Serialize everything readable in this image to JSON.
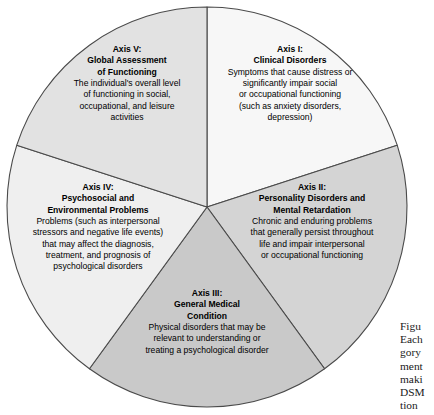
{
  "figure": {
    "type": "pie-segment-diagram",
    "title_visible": false,
    "center": {
      "x": 207,
      "y": 207
    },
    "radius": 200,
    "outline_color": "#4a4a4a",
    "segments": [
      {
        "id": "axis-1",
        "label": "Axis I",
        "title_lines": [
          "Axis I:",
          "Clinical Disorders"
        ],
        "body_lines": [
          "Symptoms that cause distress or",
          "significantly impair social",
          "or occupational functioning",
          "(such as anxiety disorders,",
          "depression)"
        ],
        "fill": "#f7f7f7",
        "start_angle_deg": 0,
        "end_angle_deg": 72,
        "text_anchor": {
          "x": 290,
          "y": 52
        }
      },
      {
        "id": "axis-2",
        "label": "Axis II",
        "title_lines": [
          "Axis II:",
          "Personality Disorders and",
          "Mental Retardation"
        ],
        "body_lines": [
          "Chronic and enduring problems",
          "that generally persist throughout",
          "life and impair interpersonal",
          "or occupational functioning"
        ],
        "fill": "#d4d4d4",
        "start_angle_deg": 72,
        "end_angle_deg": 144,
        "text_anchor": {
          "x": 312,
          "y": 190
        }
      },
      {
        "id": "axis-3",
        "label": "Axis III",
        "title_lines": [
          "Axis III:",
          "General Medical",
          "Condition"
        ],
        "body_lines": [
          "Physical disorders that may be",
          "relevant to understanding or",
          "treating a psychological disorder"
        ],
        "fill": "#c9c9c9",
        "start_angle_deg": 144,
        "end_angle_deg": 216,
        "text_anchor": {
          "x": 207,
          "y": 296
        }
      },
      {
        "id": "axis-4",
        "label": "Axis IV",
        "title_lines": [
          "Axis IV:",
          "Psychosocial and",
          "Environmental Problems"
        ],
        "body_lines": [
          "Problems (such as interpersonal",
          "stressors and negative life events)",
          "that may affect the diagnosis,",
          "treatment, and prognosis of",
          "psychological disorders"
        ],
        "fill": "#efefef",
        "start_angle_deg": 216,
        "end_angle_deg": 288,
        "text_anchor": {
          "x": 98,
          "y": 190
        }
      },
      {
        "id": "axis-5",
        "label": "Axis V",
        "title_lines": [
          "Axis V:",
          "Global Assessment",
          "of Functioning"
        ],
        "body_lines": [
          "The individual's overall level",
          "of functioning in social,",
          "occupational, and leisure",
          "activities"
        ],
        "fill": "#e2e2e2",
        "start_angle_deg": 288,
        "end_angle_deg": 360,
        "text_anchor": {
          "x": 127,
          "y": 52
        }
      }
    ]
  },
  "caption": {
    "clipped": true,
    "lines": [
      "Figu",
      "Each",
      "gory",
      "ment",
      "maki",
      "DSM",
      "tion"
    ]
  }
}
